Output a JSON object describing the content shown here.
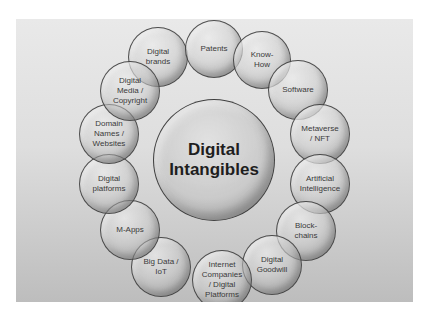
{
  "diagram": {
    "type": "hub-and-ring bubble diagram",
    "center": {
      "label": "Digital\nIntangibles",
      "cx": 214,
      "cy": 160,
      "r": 61
    },
    "ring": [
      {
        "id": "digital-brands",
        "label": "Digital\nbrands",
        "cx": 158,
        "cy": 57,
        "r": 30
      },
      {
        "id": "patents",
        "label": "Patents",
        "cx": 214,
        "cy": 49,
        "r": 29
      },
      {
        "id": "know-how",
        "label": "Know-\nHow",
        "cx": 262,
        "cy": 60,
        "r": 29
      },
      {
        "id": "software",
        "label": "Software",
        "cx": 298,
        "cy": 90,
        "r": 30
      },
      {
        "id": "metaverse-nft",
        "label": "Metaverse\n/ NFT",
        "cx": 320,
        "cy": 134,
        "r": 30
      },
      {
        "id": "artificial-intelligence",
        "label": "Artificial\nIntelligence",
        "cx": 320,
        "cy": 184,
        "r": 30
      },
      {
        "id": "blockchains",
        "label": "Block-\nchains",
        "cx": 306,
        "cy": 231,
        "r": 30
      },
      {
        "id": "digital-goodwill",
        "label": "Digital\nGoodwill",
        "cx": 272,
        "cy": 265,
        "r": 30
      },
      {
        "id": "internet-companies",
        "label": "Internet\nCompanies\n/ Digital\nPlatforms",
        "cx": 222,
        "cy": 280,
        "r": 30
      },
      {
        "id": "big-data-iot",
        "label": "Big Data /\nIoT",
        "cx": 161,
        "cy": 267,
        "r": 30
      },
      {
        "id": "m-apps",
        "label": "M-Apps",
        "cx": 130,
        "cy": 230,
        "r": 30
      },
      {
        "id": "digital-platforms",
        "label": "Digital\nplatforms",
        "cx": 109,
        "cy": 184,
        "r": 30
      },
      {
        "id": "domain-names-websites",
        "label": "Domain\nNames /\nWebsites",
        "cx": 109,
        "cy": 134,
        "r": 30
      },
      {
        "id": "digital-media-copyright",
        "label": "Digital\nMedia /\nCopyright",
        "cx": 130,
        "cy": 91,
        "r": 30
      }
    ]
  },
  "colors": {
    "page_background": "#ffffff",
    "slide_gradient_top": "#e9e9e9",
    "slide_gradient_bottom": "#bdbdbd",
    "bubble_border": "#373737",
    "label_text": "#3a3a3a",
    "center_label_text": "#1e1e1e"
  }
}
